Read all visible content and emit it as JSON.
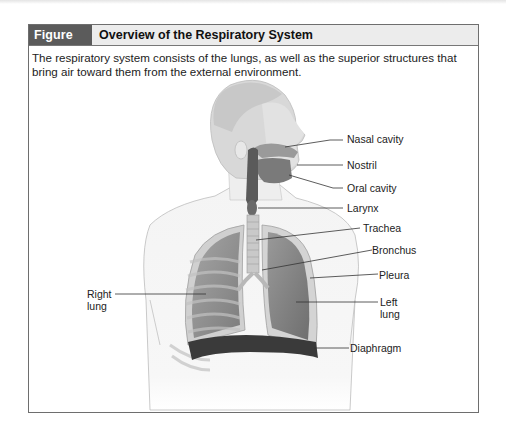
{
  "figure": {
    "number": "Figure 22.1",
    "title": "Overview of the Respiratory System",
    "caption": "The respiratory system consists of the lungs, as well as the superior structures that bring air toward them from the external environment."
  },
  "labels": {
    "nasal_cavity": "Nasal cavity",
    "nostril": "Nostril",
    "oral_cavity": "Oral cavity",
    "larynx": "Larynx",
    "trachea": "Trachea",
    "bronchus": "Bronchus",
    "pleura": "Pleura",
    "left_lung_1": "Left",
    "left_lung_2": "lung",
    "right_lung_1": "Right",
    "right_lung_2": "lung",
    "diaphragm": "Diaphragm"
  },
  "colors": {
    "header_box": "#5b5b5b",
    "header_bar": "#ececec",
    "border": "#6e6e6e",
    "lung": "#8c8c8c",
    "diaphragm": "#3a3a3a"
  }
}
